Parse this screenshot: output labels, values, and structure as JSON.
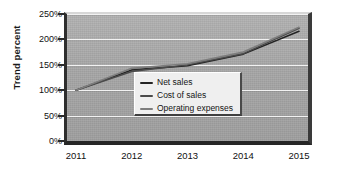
{
  "chart_data": {
    "type": "line",
    "title": "",
    "subtitle": "",
    "xlabel": "",
    "ylabel": "Trend percent",
    "x": [
      "2011",
      "2012",
      "2013",
      "2014",
      "2015"
    ],
    "categories": [
      "2011",
      "2012",
      "2013",
      "2014",
      "2015"
    ],
    "series": [
      {
        "name": "Net sales",
        "values": [
          100,
          140,
          148,
          171,
          216
        ],
        "color": "#242424"
      },
      {
        "name": "Cost of sales",
        "values": [
          100,
          137,
          150,
          172,
          222
        ],
        "color": "#4a4a4a"
      },
      {
        "name": "Operating expenses",
        "values": [
          100,
          143,
          152,
          175,
          224
        ],
        "color": "#7d7d7d"
      }
    ],
    "ylim": [
      0,
      250
    ],
    "ytick_labels": [
      "250%",
      "200%",
      "150%",
      "100%",
      "50%",
      "0%"
    ],
    "ytick_values": [
      250,
      200,
      150,
      100,
      50,
      0
    ],
    "xtick_labels": [
      "2011",
      "2012",
      "2013",
      "2014",
      "2015"
    ],
    "grid": true,
    "grid_axis": "y",
    "legend_position": "lower-right-inside",
    "plot_background_color": "#a9a9a9",
    "gridline_color": "#f2f2f2",
    "page_background_color": "#ffffff"
  },
  "axes": {
    "y_title": "Trend percent",
    "y_ticks": [
      {
        "label": "250%",
        "value": 250
      },
      {
        "label": "200%",
        "value": 200
      },
      {
        "label": "150%",
        "value": 150
      },
      {
        "label": "100%",
        "value": 100
      },
      {
        "label": "50%",
        "value": 50
      },
      {
        "label": "0%",
        "value": 0
      }
    ],
    "x_ticks": [
      {
        "label": "2011"
      },
      {
        "label": "2012"
      },
      {
        "label": "2013"
      },
      {
        "label": "2014"
      },
      {
        "label": "2015"
      }
    ]
  },
  "legend": {
    "items": [
      {
        "label": "Net sales",
        "color": "#242424"
      },
      {
        "label": "Cost of sales",
        "color": "#4a4a4a"
      },
      {
        "label": "Operating expenses",
        "color": "#7d7d7d"
      }
    ]
  }
}
